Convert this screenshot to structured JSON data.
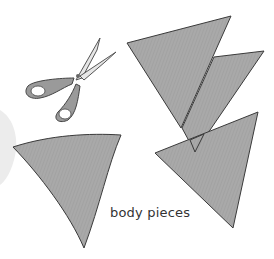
{
  "illustration": {
    "caption": "body pieces",
    "objects": [
      "scissors",
      "triangle-piece-top-left",
      "triangle-piece-top-right",
      "curved-triangle-piece-left",
      "triangle-piece-bottom-right"
    ],
    "colors": {
      "piece_fill": "#a8a8a8",
      "piece_stroke": "#3a3a3a",
      "scissor_handle": "#9a9a9a",
      "scissor_blade": "#e6e6e6",
      "ghost_shape": "#ececec"
    }
  }
}
